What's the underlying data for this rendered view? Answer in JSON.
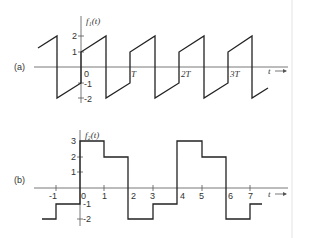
{
  "figure": {
    "panel_a": {
      "label": "(a)",
      "function_label": "f₁(t)",
      "x_axis_label": "t",
      "y_ticks": [
        "2",
        "1",
        "-1",
        "-2"
      ],
      "x_ticks": [
        "0",
        "T",
        "2T",
        "3T"
      ]
    },
    "panel_b": {
      "label": "(b)",
      "function_label": "f₂(t)",
      "x_axis_label": "t",
      "y_ticks": [
        "3",
        "2",
        "1",
        "-1",
        "-2"
      ],
      "x_ticks": [
        "-1",
        "0",
        "1",
        "2",
        "3",
        "4",
        "5",
        "6",
        "7"
      ]
    }
  },
  "colors": {
    "line": "#222222",
    "axis": "#555555",
    "background": "#ffffff",
    "edge_line": "#e6e6e6"
  }
}
